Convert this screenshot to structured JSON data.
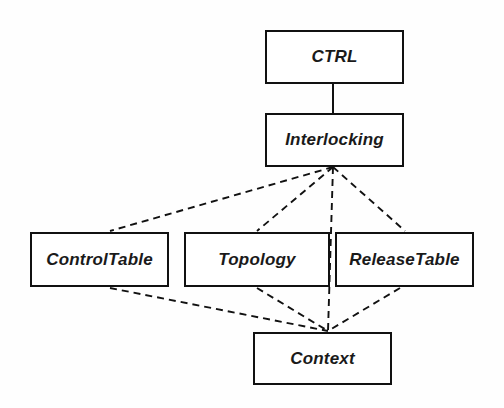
{
  "diagram": {
    "type": "class-package-diagram",
    "background_color": "#fefefe",
    "line_color": "#111111",
    "text_color": "#1a1a1a",
    "nodes": [
      {
        "id": "ctrl",
        "label": "CTRL",
        "x": 265,
        "y": 30,
        "w": 139,
        "h": 54
      },
      {
        "id": "interlocking",
        "label": "Interlocking",
        "x": 265,
        "y": 113,
        "w": 139,
        "h": 54
      },
      {
        "id": "controltable",
        "label": "ControlTable",
        "x": 30,
        "y": 232,
        "w": 139,
        "h": 55
      },
      {
        "id": "topology",
        "label": "Topology",
        "x": 184,
        "y": 232,
        "w": 146,
        "h": 55
      },
      {
        "id": "releasetable",
        "label": "ReleaseTable",
        "x": 335,
        "y": 232,
        "w": 139,
        "h": 55
      },
      {
        "id": "context",
        "label": "Context",
        "x": 253,
        "y": 332,
        "w": 139,
        "h": 53
      }
    ],
    "edges": [
      {
        "id": "ctrl-interlocking",
        "from": "ctrl",
        "to": "interlocking",
        "style": "solid",
        "x1": 333,
        "y1": 84,
        "x2": 333,
        "y2": 113
      },
      {
        "id": "interlocking-controltable",
        "from": "interlocking",
        "to": "controltable",
        "style": "dashed",
        "x1": 333,
        "y1": 167,
        "x2": 110,
        "y2": 231
      },
      {
        "id": "interlocking-topology",
        "from": "interlocking",
        "to": "topology",
        "style": "dashed",
        "x1": 333,
        "y1": 167,
        "x2": 257,
        "y2": 231
      },
      {
        "id": "interlocking-context",
        "from": "interlocking",
        "to": "context",
        "style": "dashed",
        "x1": 333,
        "y1": 167,
        "x2": 328,
        "y2": 331
      },
      {
        "id": "interlocking-releasetable",
        "from": "interlocking",
        "to": "releasetable",
        "style": "dashed",
        "x1": 333,
        "y1": 167,
        "x2": 405,
        "y2": 231
      },
      {
        "id": "controltable-context",
        "from": "controltable",
        "to": "context",
        "style": "dashed",
        "x1": 110,
        "y1": 288,
        "x2": 328,
        "y2": 331
      },
      {
        "id": "topology-context",
        "from": "topology",
        "to": "context",
        "style": "dashed",
        "x1": 257,
        "y1": 288,
        "x2": 328,
        "y2": 331
      },
      {
        "id": "releasetable-context",
        "from": "releasetable",
        "to": "context",
        "style": "dashed",
        "x1": 400,
        "y1": 288,
        "x2": 328,
        "y2": 331
      }
    ]
  }
}
